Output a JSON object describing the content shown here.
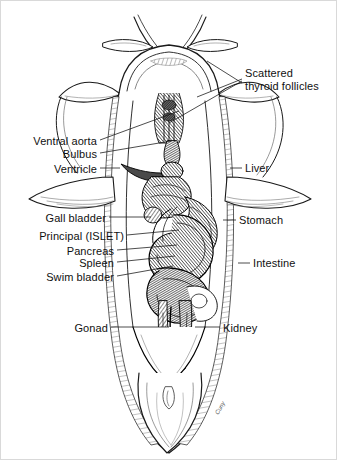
{
  "figure": {
    "width": 337,
    "height": 460,
    "background": "#ffffff",
    "ink": "#1a1a1a",
    "label_color": "#111111",
    "signature": "Cuny"
  },
  "labels": [
    {
      "id": "scattered-thyroid-follicles",
      "text": "Scattered\nthyroid follicles",
      "line1": "Scattered",
      "line2": "thyroid follicles",
      "side": "right",
      "x": 244,
      "y": 66,
      "leaders": [
        {
          "x1": 241,
          "y1": 78,
          "x2": 196,
          "y2": 96
        },
        {
          "x1": 241,
          "y1": 80,
          "x2": 168,
          "y2": 122
        },
        {
          "x1": 241,
          "y1": 82,
          "x2": 206,
          "y2": 60
        }
      ]
    },
    {
      "id": "ventral-aorta",
      "text": "Ventral aorta",
      "side": "left",
      "x": 96,
      "y": 134,
      "leaders": [
        {
          "x1": 99,
          "y1": 139,
          "x2": 178,
          "y2": 110
        }
      ]
    },
    {
      "id": "bulbus",
      "text": "Bulbus",
      "side": "left",
      "x": 96,
      "y": 147,
      "leaders": [
        {
          "x1": 99,
          "y1": 152,
          "x2": 170,
          "y2": 140
        }
      ]
    },
    {
      "id": "ventricle",
      "text": "Ventricle",
      "side": "left",
      "x": 96,
      "y": 162,
      "leaders": [
        {
          "x1": 99,
          "y1": 167,
          "x2": 119,
          "y2": 167
        }
      ]
    },
    {
      "id": "liver",
      "text": "Liver",
      "side": "right",
      "x": 244,
      "y": 161,
      "leaders": [
        {
          "x1": 241,
          "y1": 167,
          "x2": 229,
          "y2": 167
        }
      ]
    },
    {
      "id": "gall-bladder",
      "text": "Gall bladder",
      "side": "left",
      "x": 105,
      "y": 211,
      "leaders": [
        {
          "x1": 108,
          "y1": 216,
          "x2": 150,
          "y2": 216
        }
      ]
    },
    {
      "id": "stomach",
      "text": "Stomach",
      "side": "right",
      "x": 238,
      "y": 213,
      "leaders": [
        {
          "x1": 235,
          "y1": 219,
          "x2": 222,
          "y2": 219
        }
      ]
    },
    {
      "id": "principal-islet",
      "text": "Principal (ISLET)",
      "side": "left",
      "x": 123,
      "y": 229,
      "leaders": [
        {
          "x1": 126,
          "y1": 234,
          "x2": 178,
          "y2": 229
        }
      ]
    },
    {
      "id": "pancreas",
      "text": "Pancreas",
      "side": "left",
      "x": 113,
      "y": 244,
      "leaders": [
        {
          "x1": 116,
          "y1": 249,
          "x2": 176,
          "y2": 244
        }
      ]
    },
    {
      "id": "spleen",
      "text": "Spleen",
      "side": "left",
      "x": 113,
      "y": 256,
      "leaders": [
        {
          "x1": 116,
          "y1": 261,
          "x2": 174,
          "y2": 255
        }
      ]
    },
    {
      "id": "intestine",
      "text": "Intestine",
      "side": "right",
      "x": 252,
      "y": 256,
      "leaders": [
        {
          "x1": 249,
          "y1": 262,
          "x2": 237,
          "y2": 262
        }
      ]
    },
    {
      "id": "swim-bladder",
      "text": "Swim bladder",
      "side": "left",
      "x": 113,
      "y": 270,
      "leaders": [
        {
          "x1": 116,
          "y1": 275,
          "x2": 172,
          "y2": 265
        }
      ]
    },
    {
      "id": "gonad",
      "text": "Gonad",
      "side": "left",
      "x": 107,
      "y": 321,
      "leaders": [
        {
          "x1": 110,
          "y1": 326,
          "x2": 168,
          "y2": 326
        }
      ]
    },
    {
      "id": "kidney",
      "text": "Kidney",
      "side": "right",
      "x": 222,
      "y": 321,
      "leaders": [
        {
          "x1": 219,
          "y1": 326,
          "x2": 194,
          "y2": 326
        }
      ]
    }
  ],
  "organs": [
    {
      "id": "head",
      "name": "head with opened opercular flaps"
    },
    {
      "id": "barbels",
      "name": "barbels"
    },
    {
      "id": "gill-arches",
      "name": "gill arches"
    },
    {
      "id": "heart",
      "name": "heart region"
    },
    {
      "id": "liver-lobe",
      "name": "liver lobe"
    },
    {
      "id": "stomach-body",
      "name": "stomach"
    },
    {
      "id": "intestinal-coil",
      "name": "coiled intestine"
    },
    {
      "id": "gonad-strand",
      "name": "gonad"
    },
    {
      "id": "kidney-strand",
      "name": "kidney"
    },
    {
      "id": "body-wall",
      "name": "reflected body wall"
    },
    {
      "id": "tail",
      "name": "tail / caudal peduncle"
    },
    {
      "id": "vent",
      "name": "vent"
    }
  ]
}
